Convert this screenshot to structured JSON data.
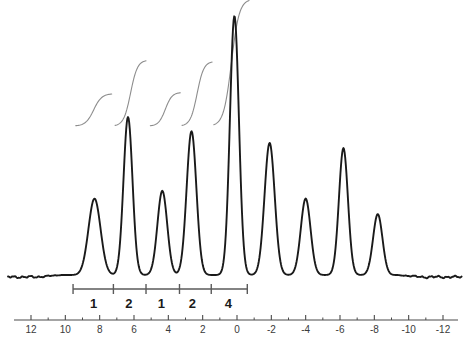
{
  "chart_data": {
    "type": "line",
    "title": "",
    "subtitle": "",
    "xlabel": "",
    "ylabel": "",
    "grid": false,
    "legend": "none",
    "axis": {
      "name": "chemical-shift-axis",
      "direction": "descending",
      "xlim": [
        13,
        -13
      ],
      "tick_labels": [
        "12",
        "10",
        "8",
        "6",
        "4",
        "2",
        "0",
        "-2",
        "-4",
        "-6",
        "-8",
        "-10",
        "-12"
      ],
      "tick_values": [
        12,
        10,
        8,
        6,
        4,
        2,
        0,
        -2,
        -4,
        -6,
        -8,
        -10,
        -12
      ],
      "minor_ticks_between": 1
    },
    "series": [
      {
        "name": "spectrum-trace",
        "color": "#1a1a1a",
        "peaks": [
          {
            "label": "p1",
            "x": 8.3,
            "height": 0.295,
            "width": 0.62
          },
          {
            "label": "p2",
            "x": 6.35,
            "height": 0.61,
            "width": 0.46
          },
          {
            "label": "p3",
            "x": 4.35,
            "height": 0.325,
            "width": 0.5
          },
          {
            "label": "p4",
            "x": 2.65,
            "height": 0.555,
            "width": 0.5
          },
          {
            "label": "p5",
            "x": 0.15,
            "height": 1.0,
            "width": 0.46
          },
          {
            "label": "p6",
            "x": -1.9,
            "height": 0.51,
            "width": 0.52
          },
          {
            "label": "p7",
            "x": -4.0,
            "height": 0.295,
            "width": 0.5
          },
          {
            "label": "p8",
            "x": -6.2,
            "height": 0.49,
            "width": 0.46
          },
          {
            "label": "p9",
            "x": -8.2,
            "height": 0.235,
            "width": 0.48
          }
        ],
        "baseline_noise": true
      }
    ],
    "integral_curves": [
      {
        "name": "integral-1",
        "start_x": 9.4,
        "end_x": 7.3,
        "rise": 0.125,
        "base_y": 0.575
      },
      {
        "name": "integral-2",
        "start_x": 7.1,
        "end_x": 5.3,
        "rise": 0.255,
        "base_y": 0.575
      },
      {
        "name": "integral-3",
        "start_x": 5.05,
        "end_x": 3.3,
        "rise": 0.13,
        "base_y": 0.575
      },
      {
        "name": "integral-4",
        "start_x": 3.2,
        "end_x": 1.45,
        "rise": 0.25,
        "base_y": 0.575
      },
      {
        "name": "integral-5",
        "start_x": 1.35,
        "end_x": -0.7,
        "rise": 0.49,
        "base_y": 0.575
      }
    ],
    "integration_bar": {
      "name": "integration-ruler",
      "start_x": 9.55,
      "end_x": -0.6,
      "segments": [
        {
          "value": "1",
          "center_x": 8.35,
          "from_x": 9.55,
          "to_x": 7.2
        },
        {
          "value": "2",
          "center_x": 6.3,
          "from_x": 7.2,
          "to_x": 5.3
        },
        {
          "value": "1",
          "center_x": 4.4,
          "from_x": 5.3,
          "to_x": 3.35
        },
        {
          "value": "2",
          "center_x": 2.6,
          "from_x": 3.35,
          "to_x": 1.5
        },
        {
          "value": "4",
          "center_x": 0.5,
          "from_x": 1.5,
          "to_x": -0.6
        }
      ]
    },
    "colors": {
      "trace": "#1a1a1a",
      "integral": "#8a8a8a",
      "axis": "#4a4a4a",
      "integration_bar": "#5a5a5a",
      "background": "#ffffff",
      "label": "#1a1a1a"
    }
  }
}
